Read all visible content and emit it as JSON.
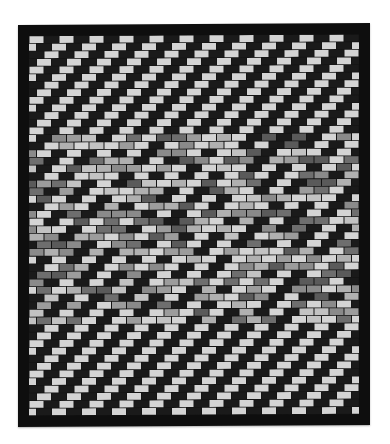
{
  "image": {
    "subject": "patchwork quilt",
    "description": "Black-and-white photo of a brick-pattern patchwork quilt with diagonal stair-step stripes of light and dark rectangles framed by a black border",
    "palette": {
      "background": "#ffffff",
      "border": "#0e0e0e",
      "light": "#d4d4d4",
      "mid_light": "#b0b0b0",
      "mid": "#8a8a8a",
      "mid_dark": "#5a5a5a",
      "dark": "#1a1a1a"
    },
    "pattern": {
      "brick_width": 15,
      "brick_height": 7.6,
      "rows": 50,
      "cols": 23
    }
  }
}
